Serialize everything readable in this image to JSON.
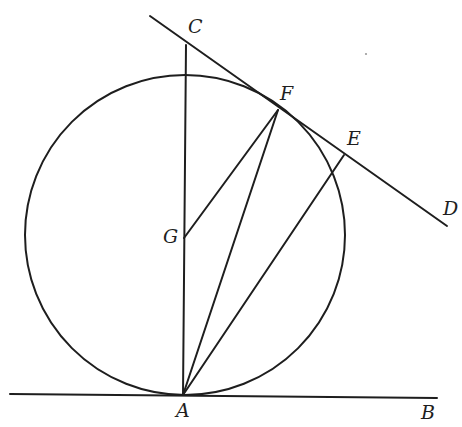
{
  "diagram": {
    "type": "geometry-figure",
    "stroke_color": "#1e1e1e",
    "background": "#ffffff",
    "circle": {
      "name": "circle-G",
      "cx": 185,
      "cy": 235,
      "r": 160
    },
    "points": {
      "A": {
        "label": "A",
        "x": 183,
        "y": 395,
        "label_x": 176,
        "label_y": 417
      },
      "B": {
        "label": "B",
        "x": 437,
        "y": 398,
        "label_x": 421,
        "label_y": 419
      },
      "C": {
        "label": "C",
        "x": 186,
        "y": 45,
        "label_x": 188,
        "label_y": 33
      },
      "D": {
        "label": "D",
        "x": 447,
        "y": 226,
        "label_x": 443,
        "label_y": 215
      },
      "E": {
        "label": "E",
        "x": 344,
        "y": 155,
        "label_x": 347,
        "label_y": 145
      },
      "F": {
        "label": "F",
        "x": 278,
        "y": 110,
        "label_x": 280,
        "label_y": 100
      },
      "G": {
        "label": "G",
        "x": 184,
        "y": 238,
        "label_x": 163,
        "label_y": 243
      }
    },
    "segments": [
      {
        "name": "tangent-line-AB",
        "from": [
          10,
          394
        ],
        "to": [
          437,
          398
        ]
      },
      {
        "name": "line-AC",
        "from": [
          183,
          395
        ],
        "to": [
          186,
          45
        ]
      },
      {
        "name": "tangent-line-CD",
        "from": [
          150,
          16
        ],
        "to": [
          447,
          226
        ]
      },
      {
        "name": "radius-GF",
        "from": [
          184,
          238
        ],
        "to": [
          278,
          110
        ]
      },
      {
        "name": "chord-AF",
        "from": [
          183,
          395
        ],
        "to": [
          278,
          110
        ]
      },
      {
        "name": "line-AE",
        "from": [
          183,
          395
        ],
        "to": [
          344,
          155
        ]
      }
    ]
  }
}
